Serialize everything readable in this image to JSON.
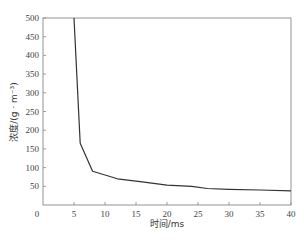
{
  "chart_data": {
    "type": "line",
    "title": "",
    "xlabel": "时间/ms",
    "ylabel": "浓度/(g · m⁻³)",
    "xlim": [
      0,
      40
    ],
    "ylim": [
      0,
      500
    ],
    "xticks": [
      0,
      5,
      10,
      15,
      20,
      25,
      30,
      35,
      40
    ],
    "yticks": [
      50,
      100,
      150,
      200,
      250,
      300,
      350,
      400,
      450,
      500
    ],
    "ytick_labels_shown": [
      "50",
      "100",
      "150",
      "200",
      "250",
      "300",
      "350",
      "400",
      "450",
      "500"
    ],
    "xtick_labels_shown": [
      "0",
      "5",
      "10",
      "15",
      "20",
      "25",
      "30",
      "35",
      "40"
    ],
    "grid": false,
    "legend": null,
    "series": [
      {
        "name": "浓度",
        "x": [
          5,
          6,
          8,
          12,
          16,
          20,
          24,
          26.5,
          30,
          35,
          40
        ],
        "y": [
          500,
          165,
          90,
          70,
          62,
          53,
          50,
          44,
          42,
          40,
          38
        ]
      }
    ]
  },
  "labels": {
    "xlabel": "时间/ms",
    "ylabel": "浓度/(g · m⁻³)"
  }
}
